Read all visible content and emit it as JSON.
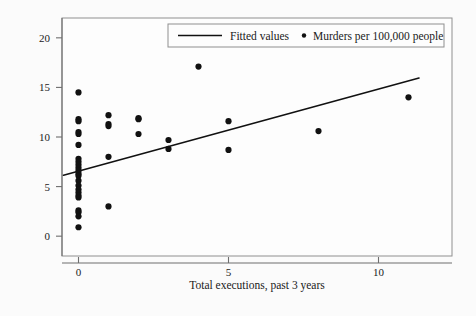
{
  "figure": {
    "background_color": "#fbfbfb",
    "frame_color": "#8a8a8a",
    "axis_color": "#6e6e6e",
    "ink_color": "#1a1a1a"
  },
  "legend": {
    "fitted_label": "Fitted values",
    "scatter_label": "Murders per 100,000 people",
    "fitted_marker": "line-marker",
    "scatter_marker": "dot-marker",
    "position": "top-center-inside"
  },
  "chart_data": {
    "type": "scatter",
    "title": "",
    "subtitle": "",
    "xlabel": "Total executions, past 3 years",
    "ylabel": "",
    "xlim": [
      -0.55,
      12.45
    ],
    "ylim": [
      -2.0,
      22.0
    ],
    "xticks": [
      0,
      5,
      10
    ],
    "xticklabels": [
      "0",
      "5",
      "10"
    ],
    "yticks": [
      0,
      5,
      10,
      15,
      20
    ],
    "yticklabels": [
      "0",
      "5",
      "10",
      "15",
      "20"
    ],
    "grid": false,
    "legend_position": "upper center",
    "series": [
      {
        "name": "Murders per 100,000 people",
        "type": "scatter",
        "marker": "circle",
        "marker_size": 3.1,
        "color": "#111111",
        "points": [
          [
            0,
            14.5
          ],
          [
            0,
            11.8
          ],
          [
            0,
            11.6
          ],
          [
            0,
            10.5
          ],
          [
            0,
            10.3
          ],
          [
            0,
            9.2
          ],
          [
            0,
            7.8
          ],
          [
            0,
            7.5
          ],
          [
            0,
            7.2
          ],
          [
            0,
            6.9
          ],
          [
            0,
            6.6
          ],
          [
            0,
            6.3
          ],
          [
            0,
            6.1
          ],
          [
            0,
            5.6
          ],
          [
            0,
            5.1
          ],
          [
            0,
            4.7
          ],
          [
            0,
            4.4
          ],
          [
            0,
            4.1
          ],
          [
            0,
            3.9
          ],
          [
            0,
            2.6
          ],
          [
            0,
            2.4
          ],
          [
            0,
            2.0
          ],
          [
            0,
            0.9
          ],
          [
            1,
            12.2
          ],
          [
            1,
            11.3
          ],
          [
            1,
            11.1
          ],
          [
            1,
            8.0
          ],
          [
            1,
            3.0
          ],
          [
            2,
            11.9
          ],
          [
            2,
            11.8
          ],
          [
            2,
            10.3
          ],
          [
            3,
            9.7
          ],
          [
            3,
            8.8
          ],
          [
            4,
            17.1
          ],
          [
            5,
            11.6
          ],
          [
            5,
            8.7
          ],
          [
            8,
            10.6
          ],
          [
            11,
            14.0
          ]
        ]
      },
      {
        "name": "Fitted values",
        "type": "line",
        "color": "#111111",
        "line_width": 1.6,
        "endpoints": [
          [
            -0.5,
            6.15
          ],
          [
            11.35,
            15.95
          ]
        ],
        "slope": 0.827,
        "intercept": 6.56
      }
    ]
  }
}
